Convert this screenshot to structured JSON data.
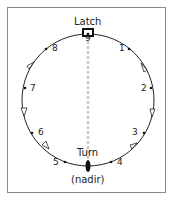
{
  "diagram": {
    "top_label": "Latch",
    "bottom_label": "Turn",
    "bottom_sublabel": "(nadir)",
    "positions": [
      "1",
      "2",
      "3",
      "4",
      "5",
      "6",
      "7",
      "8",
      "9"
    ],
    "colors": {
      "line": "#222222",
      "axis": "#c8c8c8",
      "frame": "#8a8a8a"
    }
  }
}
